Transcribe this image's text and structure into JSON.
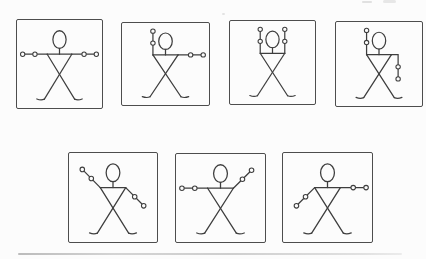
{
  "diagram": {
    "type": "stick-figure-pose-sequence",
    "line_color": "#3e3e3e",
    "frame_border_color": "#4d4d4d",
    "paper_color": "#fcfcfc",
    "rows": [
      4,
      3
    ],
    "joints_per_arm": [
      "elbow",
      "hand"
    ],
    "figures": [
      {
        "frame": "top-1",
        "left_arm": "out-horizontal",
        "right_arm": "out-horizontal"
      },
      {
        "frame": "top-2",
        "left_arm": "up-vertical",
        "right_arm": "out-horizontal"
      },
      {
        "frame": "top-3",
        "left_arm": "up-vertical",
        "right_arm": "up-vertical"
      },
      {
        "frame": "top-4",
        "left_arm": "up-vertical",
        "right_arm": "down-vertical"
      },
      {
        "frame": "bottom-1",
        "left_arm": "up-diagonal",
        "right_arm": "down-diagonal"
      },
      {
        "frame": "bottom-2",
        "left_arm": "out-horizontal",
        "right_arm": "up-diagonal"
      },
      {
        "frame": "bottom-3",
        "left_arm": "down-diagonal",
        "right_arm": "out-horizontal"
      }
    ]
  }
}
